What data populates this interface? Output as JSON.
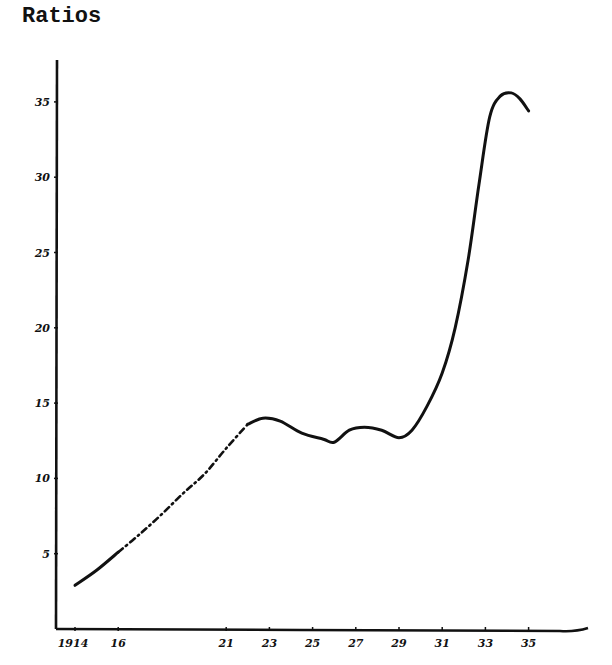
{
  "chart_data": {
    "type": "line",
    "title": "Ratios",
    "xlabel": "",
    "ylabel": "Ratios",
    "x_tick_labels": [
      "1914",
      "16",
      "21",
      "23",
      "25",
      "27",
      "29",
      "31",
      "33",
      "35"
    ],
    "x_tick_years": [
      1914,
      1916,
      1921,
      1923,
      1925,
      1927,
      1929,
      1931,
      1933,
      1935
    ],
    "y_tick_labels": [
      "5",
      "10",
      "15",
      "20",
      "25",
      "30",
      "35"
    ],
    "y_ticks": [
      5,
      10,
      15,
      20,
      25,
      30,
      35
    ],
    "xlim": [
      1913,
      1937
    ],
    "ylim": [
      0,
      38
    ],
    "grid": false,
    "legend": null,
    "series": [
      {
        "name": "Ratio",
        "segments": [
          {
            "style": "solid",
            "x": [
              1914,
              1915,
              1916
            ],
            "y": [
              2.9,
              3.9,
              5.1
            ]
          },
          {
            "style": "dash-dot",
            "x": [
              1916,
              1917,
              1918,
              1919,
              1920,
              1921,
              1922
            ],
            "y": [
              5.1,
              6.3,
              7.6,
              9.0,
              10.3,
              12.0,
              13.6
            ]
          },
          {
            "style": "solid",
            "x": [
              1922,
              1922.7,
              1923.5,
              1924.5,
              1925.5,
              1926,
              1926.7,
              1927.4,
              1928.2,
              1929,
              1929.6,
              1930.3,
              1931,
              1931.6,
              1932.2,
              1932.7,
              1933.2,
              1933.7,
              1934.2,
              1934.6,
              1935
            ],
            "y": [
              13.6,
              14.0,
              13.8,
              13.0,
              12.6,
              12.4,
              13.2,
              13.4,
              13.2,
              12.7,
              13.2,
              14.8,
              17.0,
              20.0,
              24.5,
              29.5,
              34.0,
              35.4,
              35.6,
              35.2,
              34.4
            ]
          }
        ]
      }
    ],
    "annotations": []
  },
  "layout": {
    "origin_px": {
      "x": 57,
      "y": 629
    },
    "px_per_year": 21.6,
    "px_per_unit": 15.06,
    "year0": 1914,
    "year0_px": 75,
    "axis_color": "#111111",
    "line_color": "#111111"
  }
}
